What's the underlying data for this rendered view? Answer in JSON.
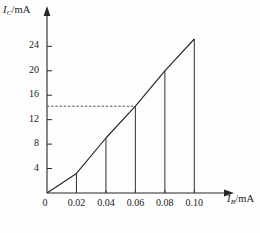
{
  "chart_data": {
    "type": "line",
    "title": "",
    "subtitle": "",
    "xlabel": "I_B/mA",
    "ylabel": "I_C/mA",
    "xlabel_symbol": "I",
    "xlabel_subscript": "B",
    "xlabel_unit": "/mA",
    "ylabel_symbol": "I",
    "ylabel_subscript": "C",
    "ylabel_unit": "/mA",
    "xlim": [
      0,
      0.112
    ],
    "ylim": [
      0,
      27
    ],
    "grid": false,
    "legend": "none",
    "x_tick_labels": [
      "0",
      "0.02",
      "0.04",
      "0.06",
      "0.08",
      "0.10"
    ],
    "x_tick_values": [
      0,
      0.02,
      0.04,
      0.06,
      0.08,
      0.1
    ],
    "y_tick_labels": [
      "4",
      "8",
      "12",
      "16",
      "20",
      "24"
    ],
    "y_tick_values": [
      4,
      8,
      12,
      16,
      20,
      24
    ],
    "series": [
      {
        "name": "transfer-characteristic",
        "style": "solid",
        "color": "#262626",
        "x": [
          0,
          0.02,
          0.04,
          0.06,
          0.08,
          0.1
        ],
        "values": [
          0,
          3.2,
          9.0,
          14.2,
          20.0,
          25.2
        ]
      }
    ],
    "drop_lines": {
      "name": "vertical-drop-lines",
      "x": [
        0.02,
        0.04,
        0.06,
        0.08,
        0.1
      ],
      "values": [
        3.2,
        9.0,
        14.2,
        20.0,
        25.2
      ]
    },
    "annotations": [
      {
        "name": "operating-point-guide",
        "type": "dashed-horizontal",
        "y": 14.2,
        "x_from": 0,
        "x_to": 0.06,
        "label": ""
      }
    ],
    "axis_arrows": {
      "x": true,
      "y": true
    },
    "origin_label": "0"
  },
  "colors": {
    "axis": "#262626",
    "curve": "#262626",
    "dashed": "#555555",
    "drop": "#3a3a3a",
    "background": "#fdfdfd",
    "text": "#1b1b1b"
  }
}
